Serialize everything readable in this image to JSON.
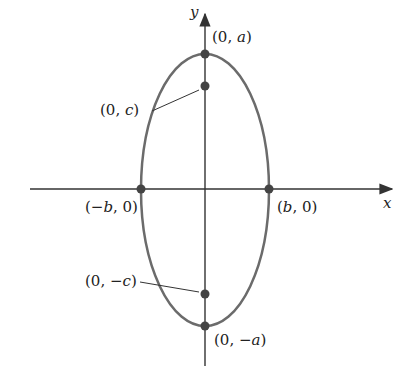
{
  "diagram": {
    "axes": {
      "x_label": "x",
      "y_label": "y"
    },
    "colors": {
      "ellipse": "#6b6b6b",
      "axis": "#333333",
      "point": "#444444"
    },
    "points": [
      {
        "id": "top-vertex",
        "label_pre": "(0, ",
        "label_var": "a",
        "label_post": ")"
      },
      {
        "id": "top-focus",
        "label_pre": "(0, ",
        "label_var": "c",
        "label_post": ")"
      },
      {
        "id": "left-covertex",
        "label_pre": "(−",
        "label_var": "b",
        "label_post": ", 0)"
      },
      {
        "id": "right-covertex",
        "label_pre": "(",
        "label_var": "b",
        "label_post": ", 0)"
      },
      {
        "id": "bottom-focus",
        "label_pre": "(0, −",
        "label_var": "c",
        "label_post": ")"
      },
      {
        "id": "bottom-vertex",
        "label_pre": "(0, −",
        "label_var": "a",
        "label_post": ")"
      }
    ]
  }
}
